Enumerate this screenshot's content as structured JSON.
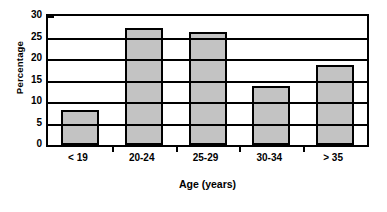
{
  "chart_data": {
    "type": "bar",
    "title": "",
    "categories": [
      "< 19",
      "20-24",
      "25-29",
      "30-34",
      "> 35"
    ],
    "values": [
      8.1,
      27.2,
      26.3,
      13.7,
      18.7
    ],
    "xlabel": "Age (years)",
    "ylabel": "Percentage",
    "ylim": [
      0,
      30
    ],
    "ytick_values": [
      0,
      5,
      10,
      15,
      20,
      25,
      30
    ],
    "ytick_labels": [
      "0",
      "5",
      "10",
      "15",
      "20",
      "25",
      "30"
    ],
    "grid": true,
    "legend": "none",
    "bar_fill_color": "#c3c3c3",
    "bar_border_color": "#000000",
    "axis_color": "#000000",
    "background_color": "#ffffff"
  }
}
